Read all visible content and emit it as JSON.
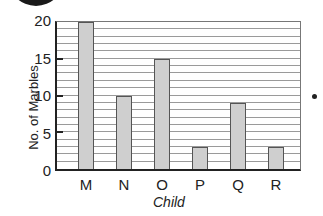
{
  "chart_data": {
    "type": "bar",
    "title": "",
    "xlabel": "Child",
    "ylabel": "No. of Marbles",
    "categories": [
      "M",
      "N",
      "O",
      "P",
      "Q",
      "R"
    ],
    "values": [
      20,
      10,
      15,
      3,
      9,
      3
    ],
    "ylim": [
      0,
      20
    ],
    "yticks": [
      "0",
      "5",
      "10",
      "15",
      "20"
    ],
    "grid": true,
    "grid_step": 1,
    "legend": "none",
    "bar_color": "#cfcfcf"
  }
}
